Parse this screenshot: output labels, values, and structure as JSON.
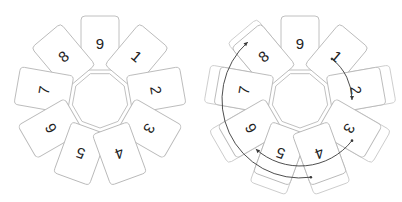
{
  "diagrams": [
    {
      "id": "left",
      "label": "card-circle-plain",
      "center": [
        100,
        100
      ],
      "cards": [
        {
          "label": "9",
          "angle": 0
        },
        {
          "label": "1",
          "angle": 40
        },
        {
          "label": "2",
          "angle": 80
        },
        {
          "label": "3",
          "angle": 120
        },
        {
          "label": "4",
          "angle": 160
        },
        {
          "label": "5",
          "angle": 200
        },
        {
          "label": "6",
          "angle": 240
        },
        {
          "label": "7",
          "angle": 280
        },
        {
          "label": "8",
          "angle": 320
        }
      ],
      "arrows": []
    },
    {
      "id": "right",
      "label": "card-circle-with-count-arrows",
      "center": [
        300,
        100
      ],
      "cards": [
        {
          "label": "9",
          "angle": 0
        },
        {
          "label": "1",
          "angle": 40
        },
        {
          "label": "2",
          "angle": 80
        },
        {
          "label": "3",
          "angle": 120
        },
        {
          "label": "4",
          "angle": 160
        },
        {
          "label": "5",
          "angle": 200
        },
        {
          "label": "6",
          "angle": 240
        },
        {
          "label": "7",
          "angle": 280
        },
        {
          "label": "8",
          "angle": 320
        }
      ],
      "ghost_cards": [
        {
          "angle": 80,
          "offset": 10
        },
        {
          "angle": 120,
          "offset": 10
        },
        {
          "angle": 160,
          "offset": 10
        },
        {
          "angle": 200,
          "offset": 10
        },
        {
          "angle": 240,
          "offset": 10
        },
        {
          "angle": 280,
          "offset": 10
        },
        {
          "angle": 320,
          "offset": 6
        }
      ],
      "arrows": [
        {
          "from": "1",
          "to": "2",
          "radius": 52,
          "start_angle": 38,
          "end_angle": 90,
          "direction": "clockwise"
        },
        {
          "from": "3",
          "to": "6",
          "radius": 66,
          "start_angle": 128,
          "end_angle": 222,
          "direction": "clockwise"
        },
        {
          "from": "4",
          "to": "8",
          "radius": 78,
          "start_angle": 172,
          "end_angle": 318,
          "direction": "clockwise"
        }
      ]
    }
  ],
  "colors": {
    "card_stroke": "#b9b9b9",
    "arrow": "#3a3a3a",
    "text": "#222222",
    "background": "#ffffff"
  }
}
